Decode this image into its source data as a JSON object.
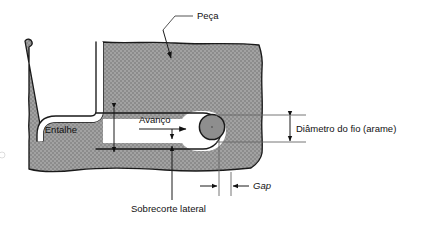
{
  "figure": {
    "title_alt": "Corte transversal de usinagem por eletroerosao a fio",
    "language": "pt-BR"
  },
  "colors": {
    "workpiece_fill": "#969696",
    "workpiece_hatch_light": "#a8a8a8",
    "workpiece_hatch_dark": "#888888",
    "outline": "#1a1a1a",
    "wire_fill": "#8a8a8a",
    "wire_outline": "#1a1a1a",
    "kerf_fill": "#ffffff",
    "background": "#ffffff",
    "leader": "#555555",
    "text": "#111111"
  },
  "labels": {
    "workpiece": "Peça",
    "kerf_depth": "Entalhe",
    "feed": "Avanço",
    "wire_diameter": "Diâmetro do fio (arame)",
    "side_overcut": "Sobrecorte lateral",
    "gap": "Gap"
  },
  "annotations": [
    {
      "id": "peca",
      "text": "Peça",
      "kind": "leader-label",
      "arrow": "down-into-workpiece"
    },
    {
      "id": "entalhe",
      "text": "Entalhe",
      "kind": "dimension-label",
      "arrow": "vertical-double"
    },
    {
      "id": "avanco",
      "text": "Avanço",
      "kind": "direction-label",
      "arrow": "right"
    },
    {
      "id": "diametro-do-fio",
      "text": "Diâmetro do fio (arame)",
      "kind": "dimension-label",
      "arrow": "vertical-double"
    },
    {
      "id": "sobrecorte-lateral",
      "text": "Sobrecorte lateral",
      "kind": "leader-label",
      "arrow": "up"
    },
    {
      "id": "gap",
      "text": "Gap",
      "kind": "dimension-label",
      "arrow": "horizontal-inward-pair",
      "italic": true
    }
  ],
  "geometry": {
    "wire": {
      "cx": 212,
      "cy": 127,
      "r": 12.5
    },
    "kerf_height": 16,
    "notch_label_position": "left-of-slot"
  }
}
